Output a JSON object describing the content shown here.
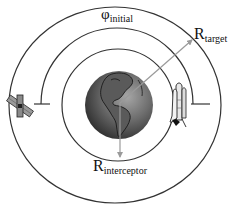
{
  "diagram": {
    "type": "orbital-rendezvous",
    "labels": {
      "phi": {
        "symbol": "φ",
        "subscript": "initial"
      },
      "r_target": {
        "symbol": "R",
        "subscript": "target"
      },
      "r_interceptor": {
        "symbol": "R",
        "subscript": "interceptor"
      }
    },
    "elements": {
      "central_body": "Earth",
      "target_vehicle": "satellite",
      "interceptor_vehicle": "space shuttle"
    },
    "orbits": [
      {
        "name": "target-orbit",
        "cx": 115,
        "cy": 105,
        "rx": 106,
        "ry": 98
      },
      {
        "name": "interceptor-orbit",
        "cx": 118,
        "cy": 105,
        "r": 56
      }
    ],
    "angle_arc": {
      "name": "phi-initial-arc",
      "cx": 117,
      "cy": 105,
      "r": 76
    },
    "colors": {
      "line": "#333333",
      "arrow": "#9a9a9a",
      "earth_dark": "#2a2a2a",
      "earth_light": "#8c8c8c"
    }
  }
}
